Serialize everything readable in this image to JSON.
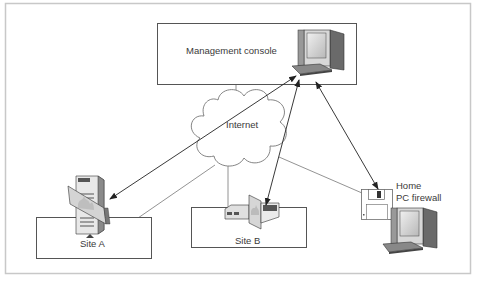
{
  "diagram": {
    "nodes": {
      "console": {
        "label": "Management console"
      },
      "internet": {
        "label": "Internet"
      },
      "site_a": {
        "label": "Site A"
      },
      "site_b": {
        "label": "Site B"
      },
      "home": {
        "label_line1": "Home",
        "label_line2": "PC firewall"
      }
    },
    "connections": [
      {
        "from": "console",
        "to": "internet",
        "style": "line"
      },
      {
        "from": "internet",
        "to": "site_a",
        "style": "line"
      },
      {
        "from": "internet",
        "to": "site_b",
        "style": "line"
      },
      {
        "from": "internet",
        "to": "home",
        "style": "line"
      },
      {
        "from": "console",
        "to": "site_a",
        "style": "double-arrow"
      },
      {
        "from": "console",
        "to": "site_b",
        "style": "double-arrow"
      },
      {
        "from": "console",
        "to": "home",
        "style": "double-arrow"
      }
    ],
    "colors": {
      "frame": "#c8c8c8",
      "box": "#555555",
      "line": "#777777",
      "arrow": "#222222",
      "text": "#3a3a3a"
    }
  }
}
